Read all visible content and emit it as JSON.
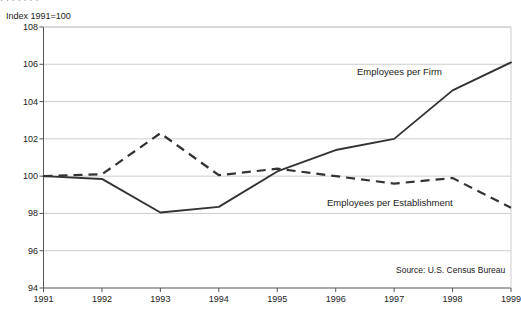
{
  "top_cut_text": "·   ·              ·          ·      ·      ·     ·",
  "axis_note": "Index 1991=100",
  "source": "Source: U.S. Census Bureau",
  "series_labels": {
    "firm": "Employees per Firm",
    "establishment": "Employees per Establishment"
  },
  "colors": {
    "line": "#333333",
    "grid": "#c8c8c8",
    "axis": "#555555",
    "text": "#1a1a1a"
  },
  "chart_data": {
    "type": "line",
    "title": "",
    "subtitle": "",
    "xlabel": "",
    "ylabel": "Index 1991=100",
    "x": [
      1991,
      1992,
      1993,
      1994,
      1995,
      1996,
      1997,
      1998,
      1999
    ],
    "categories": [
      "1991",
      "1992",
      "1993",
      "1994",
      "1995",
      "1996",
      "1997",
      "1998",
      "1999"
    ],
    "xlim": [
      1991,
      1999
    ],
    "ylim": [
      94,
      108
    ],
    "yticks": [
      94,
      96,
      98,
      100,
      102,
      104,
      106,
      108
    ],
    "ytick_labels": [
      "94",
      "96",
      "98",
      "100",
      "102",
      "104",
      "106",
      "108"
    ],
    "grid": true,
    "legend": "inline-annotations",
    "series": [
      {
        "name": "Employees per Firm",
        "style": "solid",
        "values": [
          100.0,
          99.85,
          98.05,
          98.35,
          100.25,
          101.4,
          102.0,
          104.6,
          106.1
        ]
      },
      {
        "name": "Employees per Establishment",
        "style": "dashed",
        "values": [
          100.0,
          100.1,
          102.3,
          100.05,
          100.4,
          100.0,
          99.6,
          99.9,
          98.3
        ]
      }
    ],
    "annotations": [
      {
        "text": "Employees per Firm",
        "x": 1997.0,
        "y": 105.0
      },
      {
        "text": "Employees per Establishment",
        "x": 1996.6,
        "y": 98.6
      },
      {
        "text": "Source: U.S. Census Bureau",
        "x": 1998.3,
        "y": 94.9
      }
    ]
  }
}
